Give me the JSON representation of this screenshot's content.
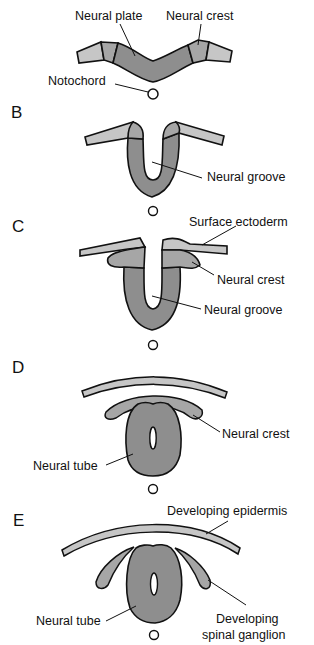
{
  "colors": {
    "surface_ectoderm": "#c6c6c6",
    "neural_crest": "#a6a6a6",
    "neural_tissue": "#8e8e8e",
    "outline": "#111111"
  },
  "panels": [
    {
      "id": "A",
      "letter": "",
      "labels": {
        "neural_plate": "Neural plate",
        "neural_crest": "Neural crest",
        "notochord": "Notochord"
      }
    },
    {
      "id": "B",
      "letter": "B",
      "labels": {
        "neural_groove": "Neural groove"
      }
    },
    {
      "id": "C",
      "letter": "C",
      "labels": {
        "surface_ectoderm": "Surface ectoderm",
        "neural_crest": "Neural crest",
        "neural_groove": "Neural groove"
      }
    },
    {
      "id": "D",
      "letter": "D",
      "labels": {
        "neural_crest": "Neural crest",
        "neural_tube": "Neural tube"
      }
    },
    {
      "id": "E",
      "letter": "E",
      "labels": {
        "developing_epidermis": "Developing epidermis",
        "neural_tube": "Neural tube",
        "developing_spinal_ganglion_line1": "Developing",
        "developing_spinal_ganglion_line2": "spinal ganglion"
      }
    }
  ]
}
